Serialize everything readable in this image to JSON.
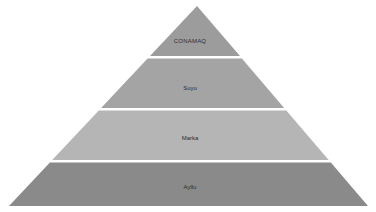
{
  "diagram": {
    "type": "pyramid",
    "title": "",
    "background_color": "#ffffff",
    "separator_color": "#ffffff",
    "label_color": "#2e2e2e",
    "levels": [
      {
        "rank": 1,
        "label": "CONAMAQ",
        "color": "#9c9c9c"
      },
      {
        "rank": 2,
        "label": "Suyu",
        "color": "#a4a4a4"
      },
      {
        "rank": 3,
        "label": "Marka",
        "color": "#b5b5b5"
      },
      {
        "rank": 4,
        "label": "Ayllu",
        "color": "#8a8a8a"
      }
    ]
  }
}
